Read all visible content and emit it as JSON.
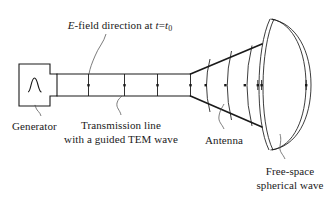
{
  "figure": {
    "stroke_color": "#1a1a1a",
    "background_color": "#ffffff"
  },
  "labels": {
    "efield": {
      "prefix_italic": "E",
      "text": "-field direction at ",
      "var_italic": "t",
      "equals": "=",
      "var2_italic": "t",
      "subscript": "0",
      "full": "E-field direction at t=t0"
    },
    "generator": "Generator",
    "transmission_line_line1": "Transmission line",
    "transmission_line_line2": "with a guided TEM wave",
    "antenna": "Antenna",
    "freespace_line1": "Free-space",
    "freespace_line2": "spherical wave"
  },
  "components": {
    "generator_symbol": "sine-wave",
    "line_ticks": 4,
    "horn_arcs": 3,
    "freespace_arcs": 4
  }
}
